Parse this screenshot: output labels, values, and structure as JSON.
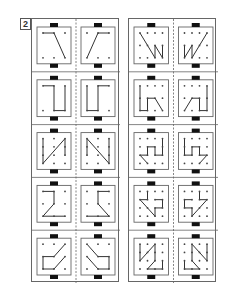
{
  "worksheet": {
    "number": "2",
    "colors": {
      "line": "#333333",
      "border": "#666666",
      "dot": "#444444",
      "tab": "#111111"
    },
    "left_panel": {
      "rows": [
        {
          "cols": 3,
          "rows": 2,
          "left": [
            [
              0,
              0,
              1,
              0
            ],
            [
              1,
              0,
              2,
              1
            ]
          ],
          "right": [
            [
              2,
              0,
              1,
              0
            ],
            [
              1,
              0,
              0,
              1
            ]
          ]
        },
        {
          "cols": 3,
          "rows": 2,
          "left": [
            [
              0,
              0,
              1,
              0
            ],
            [
              1,
              0,
              1,
              1
            ],
            [
              1,
              1,
              2,
              1
            ],
            [
              2,
              1,
              2,
              0
            ]
          ],
          "right": [
            [
              2,
              0,
              1,
              0
            ],
            [
              1,
              0,
              1,
              1
            ],
            [
              1,
              1,
              0,
              1
            ],
            [
              0,
              1,
              0,
              0
            ]
          ]
        },
        {
          "cols": 3,
          "rows": 4,
          "left": [
            [
              0,
              0,
              0,
              3
            ],
            [
              0,
              3,
              2,
              0
            ],
            [
              2,
              0,
              2,
              2
            ]
          ],
          "right": [
            [
              2,
              0,
              2,
              3
            ],
            [
              2,
              3,
              0,
              0
            ],
            [
              0,
              0,
              0,
              2
            ]
          ]
        },
        {
          "cols": 3,
          "rows": 3,
          "left": [
            [
              0,
              0,
              1,
              0
            ],
            [
              1,
              0,
              1,
              1
            ],
            [
              1,
              1,
              0,
              2
            ],
            [
              0,
              2,
              2,
              2
            ]
          ],
          "right": [
            [
              2,
              0,
              1,
              0
            ],
            [
              1,
              0,
              1,
              1
            ],
            [
              1,
              1,
              2,
              2
            ],
            [
              2,
              2,
              0,
              2
            ]
          ]
        },
        {
          "cols": 3,
          "rows": 3,
          "left": [
            [
              2,
              0,
              1,
              1
            ],
            [
              1,
              1,
              0,
              1
            ],
            [
              0,
              1,
              0,
              2
            ],
            [
              0,
              2,
              1,
              2
            ],
            [
              1,
              2,
              2,
              1
            ]
          ],
          "right": [
            [
              0,
              0,
              1,
              1
            ],
            [
              1,
              1,
              2,
              1
            ],
            [
              2,
              1,
              2,
              2
            ],
            [
              2,
              2,
              1,
              2
            ],
            [
              1,
              2,
              0,
              1
            ]
          ]
        }
      ]
    },
    "right_panel": {
      "rows": [
        {
          "cols": 4,
          "rows": 3,
          "left": [
            [
              0,
              0,
              2,
              2
            ],
            [
              2,
              2,
              2,
              1
            ],
            [
              2,
              1,
              3,
              2
            ],
            [
              3,
              2,
              3,
              1
            ]
          ],
          "right": [
            [
              3,
              0,
              1,
              2
            ],
            [
              1,
              2,
              1,
              1
            ],
            [
              1,
              1,
              0,
              2
            ],
            [
              0,
              2,
              0,
              1
            ]
          ]
        },
        {
          "cols": 4,
          "rows": 3,
          "left": [
            [
              0,
              0,
              0,
              2
            ],
            [
              0,
              2,
              1,
              2
            ],
            [
              1,
              2,
              1,
              1
            ],
            [
              1,
              1,
              2,
              1
            ],
            [
              2,
              1,
              3,
              2
            ]
          ],
          "right": [
            [
              3,
              0,
              3,
              2
            ],
            [
              3,
              2,
              2,
              2
            ],
            [
              2,
              2,
              2,
              1
            ],
            [
              2,
              1,
              1,
              1
            ],
            [
              1,
              1,
              0,
              2
            ]
          ]
        },
        {
          "cols": 4,
          "rows": 4,
          "left": [
            [
              3,
              0,
              3,
              2
            ],
            [
              3,
              2,
              2,
              2
            ],
            [
              2,
              2,
              2,
              1
            ],
            [
              2,
              1,
              1,
              1
            ],
            [
              1,
              1,
              1,
              2
            ],
            [
              1,
              2,
              0,
              2
            ],
            [
              0,
              2,
              1,
              3
            ]
          ],
          "right": [
            [
              0,
              0,
              0,
              2
            ],
            [
              0,
              2,
              1,
              2
            ],
            [
              1,
              2,
              1,
              1
            ],
            [
              1,
              1,
              2,
              1
            ],
            [
              2,
              1,
              2,
              2
            ],
            [
              2,
              2,
              3,
              2
            ],
            [
              3,
              2,
              2,
              3
            ]
          ]
        },
        {
          "cols": 4,
          "rows": 4,
          "left": [
            [
              1,
              0,
              1,
              1
            ],
            [
              1,
              1,
              0,
              1
            ],
            [
              0,
              1,
              2,
              3
            ],
            [
              2,
              3,
              2,
              2
            ],
            [
              2,
              2,
              3,
              2
            ],
            [
              3,
              2,
              3,
              1
            ],
            [
              3,
              1,
              2,
              1
            ]
          ],
          "right": [
            [
              2,
              0,
              2,
              1
            ],
            [
              2,
              1,
              3,
              1
            ],
            [
              3,
              1,
              1,
              3
            ],
            [
              1,
              3,
              1,
              2
            ],
            [
              1,
              2,
              0,
              2
            ],
            [
              0,
              2,
              0,
              1
            ],
            [
              0,
              1,
              1,
              1
            ]
          ]
        },
        {
          "cols": 4,
          "rows": 4,
          "left": [
            [
              0,
              0,
              0,
              2
            ],
            [
              0,
              2,
              2,
              0
            ],
            [
              2,
              0,
              2,
              2
            ],
            [
              2,
              2,
              1,
              3
            ],
            [
              1,
              3,
              3,
              3
            ],
            [
              3,
              3,
              3,
              2
            ]
          ],
          "right": [
            [
              3,
              0,
              3,
              2
            ],
            [
              3,
              2,
              1,
              0
            ],
            [
              1,
              0,
              1,
              2
            ],
            [
              1,
              2,
              2,
              3
            ],
            [
              2,
              3,
              0,
              3
            ],
            [
              0,
              3,
              0,
              2
            ]
          ]
        }
      ]
    }
  }
}
